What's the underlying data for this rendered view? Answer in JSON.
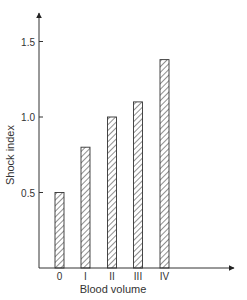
{
  "chart_data": {
    "type": "bar",
    "title": "",
    "xlabel": "Blood volume",
    "ylabel": "Shock index",
    "categories": [
      "0",
      "I",
      "II",
      "III",
      "IV"
    ],
    "values": [
      0.5,
      0.8,
      1.0,
      1.1,
      1.38
    ],
    "yticks": [
      "0.5",
      "1.0",
      "1.5"
    ],
    "ytick_values": [
      0.5,
      1.0,
      1.5
    ],
    "ylim": [
      0,
      1.7
    ],
    "grid": false,
    "legend": null,
    "bar_style": "hatched",
    "colors": {
      "axis": "#333333",
      "bar_stroke": "#333333",
      "hatch": "#333333"
    }
  }
}
